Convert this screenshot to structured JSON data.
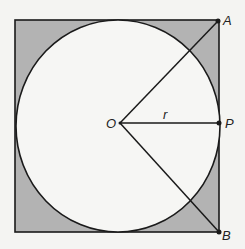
{
  "diagram": {
    "type": "geometry",
    "colors": {
      "background": "#f4f4f2",
      "shaded": "#b3b3b3",
      "circle_fill": "#f6f6f4",
      "stroke": "#1a1a1a"
    },
    "square": {
      "x": 15,
      "y": 20,
      "width": 204,
      "height": 212
    },
    "circle": {
      "cx": 118,
      "cy": 126,
      "rx": 102,
      "ry": 106
    },
    "points": {
      "O": {
        "label": "O",
        "x": 120,
        "y": 123
      },
      "A": {
        "label": "A",
        "x": 218,
        "y": 21
      },
      "P": {
        "label": "P",
        "x": 219,
        "y": 123
      },
      "B": {
        "label": "B",
        "x": 219,
        "y": 232
      }
    },
    "segments": [
      {
        "from": "O",
        "to": "A"
      },
      {
        "from": "O",
        "to": "P",
        "label": "r"
      },
      {
        "from": "O",
        "to": "B"
      }
    ],
    "labels": {
      "O": "O",
      "A": "A",
      "P": "P",
      "B": "B",
      "r": "r"
    }
  }
}
